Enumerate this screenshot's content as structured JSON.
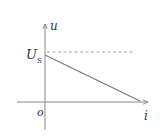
{
  "diagram": {
    "type": "u-i characteristic graph",
    "axes": {
      "vertical_label": "u",
      "horizontal_label": "i",
      "origin_label": "o"
    },
    "intercept_label": "U",
    "intercept_subscript": "S",
    "colors": {
      "axis": "#888888",
      "line": "#777777",
      "dashed": "#999999",
      "text": "#333333"
    }
  }
}
